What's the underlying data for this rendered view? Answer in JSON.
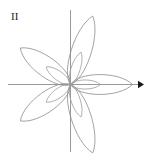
{
  "figure": {
    "label": "II",
    "canvas": {
      "width": 148,
      "height": 154,
      "background": "#ffffff"
    },
    "origin": {
      "x": 70.5,
      "y": 84.5
    },
    "axes": {
      "x_axis": {
        "x1": 8,
        "y1": 84.5,
        "x2": 143,
        "y2": 84.5,
        "arrow": "right",
        "color": "#9a9a9a"
      },
      "y_axis": {
        "x1": 70.5,
        "y1": 10,
        "x2": 70.5,
        "y2": 152,
        "arrow": "none",
        "color": "#9a9a9a"
      },
      "arrowhead": {
        "tip_x": 144,
        "tip_y": 84.5,
        "size": 6,
        "color": "#1a1a1a"
      }
    },
    "curve": {
      "name": "five-petal-rose",
      "stroke": "#8c8c8c",
      "stroke_inner": "#9c9c9c",
      "stroke_width": 0.8,
      "fill": "none"
    }
  },
  "chart_data": {
    "type": "line",
    "title": "II",
    "xlabel": "",
    "ylabel": "",
    "plot_kind": "polar-rose",
    "grid": false,
    "legend": null,
    "tick_labels": {
      "x": [],
      "y": []
    },
    "axis_ranges": {
      "x": [
        -1.2,
        1.25
      ],
      "y": [
        -1.2,
        1.2
      ]
    },
    "series": [
      {
        "name": "outer-rose",
        "equation": "r = cos(5θ/2)",
        "petal_count": 5,
        "petal_angles_deg": [
          0,
          72,
          144,
          216,
          288
        ],
        "outer_radius": 1.0,
        "stroke": "#8c8c8c"
      },
      {
        "name": "inner-rose",
        "equation": "r = 0.45 cos(5θ/2)",
        "petal_count": 5,
        "petal_angles_deg": [
          0,
          72,
          144,
          216,
          288
        ],
        "outer_radius": 0.45,
        "stroke": "#9c9c9c"
      }
    ],
    "petals": [
      {
        "angle_deg": 0,
        "direction": "right",
        "length_px": 62,
        "half_width_px": 13
      },
      {
        "angle_deg": 72,
        "direction": "up-right",
        "length_px": 72,
        "half_width_px": 13
      },
      {
        "angle_deg": 144,
        "direction": "up-left",
        "length_px": 62,
        "half_width_px": 13
      },
      {
        "angle_deg": 216,
        "direction": "down-left",
        "length_px": 62,
        "half_width_px": 13
      },
      {
        "angle_deg": 288,
        "direction": "down-right",
        "length_px": 72,
        "half_width_px": 13
      }
    ],
    "inner_petals": [
      {
        "angle_deg": 0,
        "direction": "right",
        "length_px": 30,
        "half_width_px": 6
      },
      {
        "angle_deg": 72,
        "direction": "up-right",
        "length_px": 34,
        "half_width_px": 6
      },
      {
        "angle_deg": 144,
        "direction": "up-left",
        "length_px": 30,
        "half_width_px": 6
      },
      {
        "angle_deg": 216,
        "direction": "down-left",
        "length_px": 30,
        "half_width_px": 6
      },
      {
        "angle_deg": 288,
        "direction": "down-right",
        "length_px": 34,
        "half_width_px": 6
      }
    ]
  }
}
